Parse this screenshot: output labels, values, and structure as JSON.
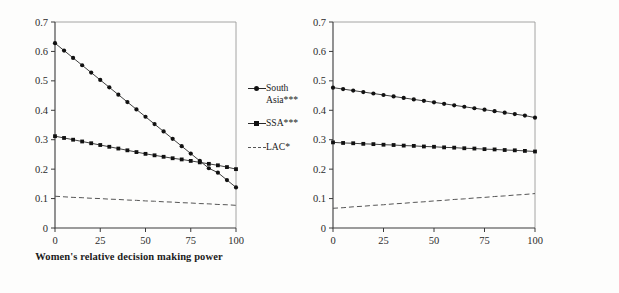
{
  "figure": {
    "background": "#fdfdfc",
    "ink_color": "#1a1a1a"
  },
  "panels": [
    {
      "id": "left",
      "xlabel": "Women's relative decision\nmaking power",
      "legend": [
        {
          "label": "South\nAsia***",
          "marker": "circle",
          "style": "solid"
        },
        {
          "label": "SSA***",
          "marker": "square",
          "style": "solid"
        },
        {
          "label": "LAC*",
          "marker": "none",
          "style": "dashed"
        }
      ]
    },
    {
      "id": "right",
      "xlabel": "Societal gender equality",
      "legend": [
        {
          "label": "South\nAsia***",
          "marker": "circle",
          "style": "solid"
        },
        {
          "label": "SSA",
          "marker": "square",
          "style": "solid"
        },
        {
          "label": "LAC",
          "marker": "none",
          "style": "dashed"
        }
      ]
    }
  ],
  "chart_data": [
    {
      "type": "line",
      "title": "",
      "panel": "left",
      "xlabel": "Women's relative decision making power",
      "ylabel": "",
      "xlim": [
        0,
        100
      ],
      "ylim": [
        0,
        0.7
      ],
      "xticks": [
        0,
        25,
        50,
        75,
        100
      ],
      "yticks": [
        0,
        0.1,
        0.2,
        0.3,
        0.4,
        0.5,
        0.6,
        0.7
      ],
      "xticklabels": [
        "0",
        "25",
        "50",
        "75",
        "100"
      ],
      "yticklabels": [
        "0",
        "0.1",
        "0.2",
        "0.3",
        "0.4",
        "0.5",
        "0.6",
        "0.7"
      ],
      "grid": false,
      "legend_position": "right",
      "x": [
        0,
        5,
        10,
        15,
        20,
        25,
        30,
        35,
        40,
        45,
        50,
        55,
        60,
        65,
        70,
        75,
        80,
        85,
        90,
        95,
        100
      ],
      "series": [
        {
          "name": "South Asia***",
          "marker": "circle",
          "style": "solid",
          "values": [
            0.628,
            0.603,
            0.578,
            0.553,
            0.528,
            0.503,
            0.478,
            0.453,
            0.428,
            0.403,
            0.378,
            0.353,
            0.328,
            0.303,
            0.278,
            0.253,
            0.228,
            0.203,
            0.188,
            0.163,
            0.138
          ]
        },
        {
          "name": "SSA***",
          "marker": "square",
          "style": "solid",
          "values": [
            0.312,
            0.306,
            0.3,
            0.294,
            0.288,
            0.282,
            0.276,
            0.27,
            0.264,
            0.258,
            0.252,
            0.247,
            0.242,
            0.237,
            0.233,
            0.228,
            0.223,
            0.218,
            0.213,
            0.207,
            0.2
          ]
        },
        {
          "name": "LAC*",
          "marker": "none",
          "style": "dashed",
          "values": [
            0.108,
            0.106,
            0.104,
            0.103,
            0.101,
            0.1,
            0.098,
            0.097,
            0.095,
            0.094,
            0.092,
            0.091,
            0.089,
            0.088,
            0.086,
            0.085,
            0.083,
            0.082,
            0.08,
            0.079,
            0.077
          ]
        }
      ]
    },
    {
      "type": "line",
      "title": "",
      "panel": "right",
      "xlabel": "Societal gender equality",
      "ylabel": "",
      "xlim": [
        0,
        100
      ],
      "ylim": [
        0,
        0.7
      ],
      "xticks": [
        0,
        25,
        50,
        75,
        100
      ],
      "yticks": [
        0,
        0.1,
        0.2,
        0.3,
        0.4,
        0.5,
        0.6,
        0.7
      ],
      "xticklabels": [
        "0",
        "25",
        "50",
        "75",
        "100"
      ],
      "yticklabels": [
        "0",
        "0.1",
        "0.2",
        "0.3",
        "0.4",
        "0.5",
        "0.6",
        "0.7"
      ],
      "grid": false,
      "legend_position": "right",
      "x": [
        0,
        5,
        10,
        15,
        20,
        25,
        30,
        35,
        40,
        45,
        50,
        55,
        60,
        65,
        70,
        75,
        80,
        85,
        90,
        95,
        100
      ],
      "series": [
        {
          "name": "South Asia***",
          "marker": "circle",
          "style": "solid",
          "values": [
            0.477,
            0.472,
            0.467,
            0.462,
            0.457,
            0.452,
            0.447,
            0.442,
            0.437,
            0.432,
            0.427,
            0.422,
            0.417,
            0.412,
            0.407,
            0.402,
            0.397,
            0.392,
            0.387,
            0.382,
            0.375
          ]
        },
        {
          "name": "SSA",
          "marker": "square",
          "style": "solid",
          "values": [
            0.291,
            0.289,
            0.288,
            0.286,
            0.285,
            0.283,
            0.282,
            0.28,
            0.279,
            0.277,
            0.276,
            0.274,
            0.273,
            0.271,
            0.27,
            0.268,
            0.267,
            0.265,
            0.264,
            0.262,
            0.26
          ]
        },
        {
          "name": "LAC",
          "marker": "none",
          "style": "dashed",
          "values": [
            0.067,
            0.069,
            0.072,
            0.074,
            0.077,
            0.079,
            0.082,
            0.084,
            0.087,
            0.089,
            0.092,
            0.094,
            0.097,
            0.099,
            0.102,
            0.104,
            0.107,
            0.109,
            0.112,
            0.114,
            0.117
          ]
        }
      ]
    }
  ]
}
